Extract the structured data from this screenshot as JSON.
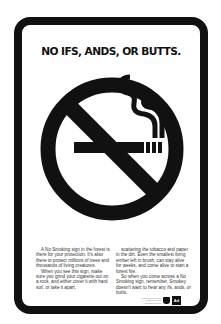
{
  "poster": {
    "headline": "NO IFS, ANDS, OR BUTTS.",
    "sign_icon": "no-smoking-icon",
    "body_left": [
      "A No Smoking sign in the forest is there for your protection. It's also there to protect millions of trees and thousands of living creatures.",
      "When you see this sign, make sure you grind your cigarette out on a rock, and either cover it with hard soil, or take it apart,"
    ],
    "body_right": [
      "scattering the tobacco and paper in the dirt. Even the smallest living ember left in brush, can stay alive for weeks, and come alive to start a forest fire.",
      "So when you come across a No Smoking sign, remember, Smokey doesn't want to hear any ifs, ands, or butts."
    ],
    "fine_print": "A Public Service of This Magazine & The Advertising Council",
    "logos": [
      "forest-service-shield",
      "ad-council-logo"
    ],
    "colors": {
      "ink": "#111111",
      "paper": "#ffffff"
    }
  }
}
